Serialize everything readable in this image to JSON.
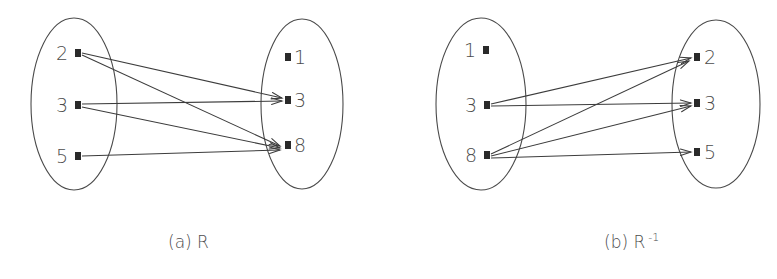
{
  "figure": {
    "background_color": "#ffffff",
    "line_color": "#3c3c3c",
    "ellipse_color": "#4a4a4a",
    "label_color": "#4c4c4c",
    "dot_color": "#2a2a2a"
  },
  "diagrams": [
    {
      "id": "diagram-a",
      "caption_prefix": "(a)",
      "caption_symbol": "R",
      "caption_superscript": "",
      "domain_set": {
        "name": "domain-set-a",
        "nodes": [
          {
            "label": "2",
            "cx": 78,
            "cy": 53,
            "label_x": 62,
            "label_y": 60
          },
          {
            "label": "3",
            "cx": 78,
            "cy": 105,
            "label_x": 62,
            "label_y": 112
          },
          {
            "label": "5",
            "cx": 78,
            "cy": 156,
            "label_x": 62,
            "label_y": 163
          }
        ],
        "ellipse": {
          "cx": 74,
          "cy": 104,
          "rx": 43,
          "ry": 86
        }
      },
      "codomain_set": {
        "name": "codomain-set-a",
        "nodes": [
          {
            "label": "1",
            "cx": 288,
            "cy": 57,
            "label_x": 300,
            "label_y": 64
          },
          {
            "label": "3",
            "cx": 288,
            "cy": 100,
            "label_x": 300,
            "label_y": 107
          },
          {
            "label": "8",
            "cx": 288,
            "cy": 145,
            "label_x": 300,
            "label_y": 152
          }
        ],
        "ellipse": {
          "cx": 302,
          "cy": 104,
          "rx": 41,
          "ry": 85
        }
      },
      "edges": [
        {
          "from": "2",
          "to": "3",
          "x1": 82,
          "y1": 53,
          "x2": 282,
          "y2": 98
        },
        {
          "from": "2",
          "to": "8",
          "x1": 82,
          "y1": 55,
          "x2": 280,
          "y2": 146
        },
        {
          "from": "3",
          "to": "3",
          "x1": 82,
          "y1": 104,
          "x2": 282,
          "y2": 101
        },
        {
          "from": "3",
          "to": "8",
          "x1": 82,
          "y1": 107,
          "x2": 280,
          "y2": 148
        },
        {
          "from": "5",
          "to": "8",
          "x1": 82,
          "y1": 156,
          "x2": 280,
          "y2": 150
        }
      ]
    },
    {
      "id": "diagram-b",
      "caption_prefix": "(b)",
      "caption_symbol": "R",
      "caption_superscript": "-1",
      "domain_set": {
        "name": "domain-set-b",
        "nodes": [
          {
            "label": "1",
            "cx": 486,
            "cy": 50,
            "label_x": 470,
            "label_y": 57
          },
          {
            "label": "3",
            "cx": 487,
            "cy": 105,
            "label_x": 471,
            "label_y": 112
          },
          {
            "label": "8",
            "cx": 487,
            "cy": 155,
            "label_x": 471,
            "label_y": 162
          }
        ],
        "ellipse": {
          "cx": 481,
          "cy": 104,
          "rx": 45,
          "ry": 86
        }
      },
      "codomain_set": {
        "name": "codomain-set-b",
        "nodes": [
          {
            "label": "2",
            "cx": 697,
            "cy": 57,
            "label_x": 710,
            "label_y": 64
          },
          {
            "label": "3",
            "cx": 697,
            "cy": 103,
            "label_x": 710,
            "label_y": 110
          },
          {
            "label": "5",
            "cx": 697,
            "cy": 152,
            "label_x": 710,
            "label_y": 159
          }
        ],
        "ellipse": {
          "cx": 716,
          "cy": 104,
          "rx": 44,
          "ry": 84
        }
      },
      "edges": [
        {
          "from": "3",
          "to": "2",
          "x1": 491,
          "y1": 104,
          "x2": 691,
          "y2": 58
        },
        {
          "from": "3",
          "to": "3",
          "x1": 491,
          "y1": 106,
          "x2": 691,
          "y2": 103
        },
        {
          "from": "8",
          "to": "2",
          "x1": 491,
          "y1": 154,
          "x2": 689,
          "y2": 61
        },
        {
          "from": "8",
          "to": "3",
          "x1": 491,
          "y1": 156,
          "x2": 691,
          "y2": 106
        },
        {
          "from": "8",
          "to": "5",
          "x1": 491,
          "y1": 158,
          "x2": 691,
          "y2": 152
        }
      ]
    }
  ],
  "captions": [
    {
      "name": "caption-a",
      "x": 168,
      "y": 248,
      "prefix": "(a)",
      "symbol": "R",
      "superscript": ""
    },
    {
      "name": "caption-b",
      "x": 604,
      "y": 248,
      "prefix": "(b)",
      "symbol": "R",
      "superscript": "-1"
    }
  ]
}
